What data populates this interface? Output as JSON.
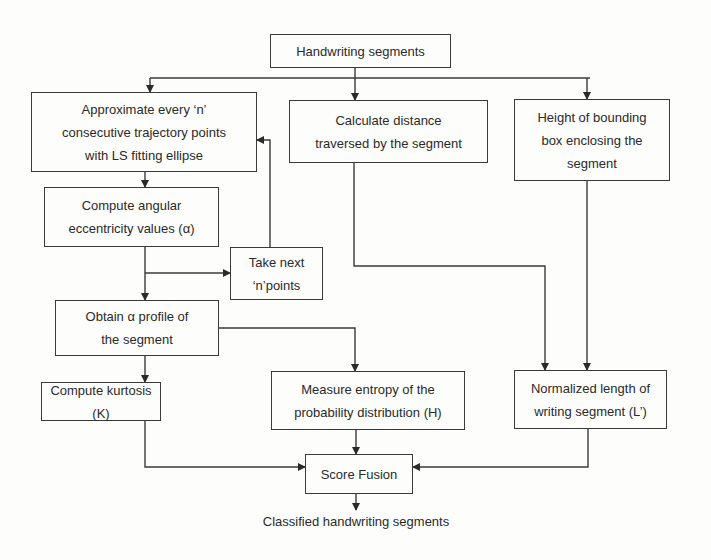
{
  "diagram": {
    "type": "flowchart",
    "nodes": {
      "input": {
        "label": "Handwriting segments"
      },
      "approx": {
        "lines": [
          "Approximate every ‘n’",
          "consecutive trajectory points",
          "with LS fitting ellipse"
        ]
      },
      "distance": {
        "lines": [
          "Calculate distance",
          "traversed by the segment"
        ]
      },
      "height": {
        "lines": [
          "Height of bounding",
          "box enclosing the",
          "segment"
        ]
      },
      "angular": {
        "lines": [
          "Compute angular",
          "eccentricity values (α)"
        ]
      },
      "next": {
        "lines": [
          "Take next",
          "‘n’points"
        ]
      },
      "profile": {
        "lines": [
          "Obtain α profile of",
          "the segment"
        ]
      },
      "kurtosis": {
        "label": "Compute kurtosis (K)"
      },
      "entropy": {
        "lines": [
          "Measure entropy of the",
          "probability distribution (H)"
        ]
      },
      "normlen": {
        "lines": [
          "Normalized length of",
          "writing segment (L’)"
        ]
      },
      "fusion": {
        "label": "Score Fusion"
      },
      "output": {
        "label": "Classified handwriting segments"
      }
    },
    "edges": [
      [
        "input",
        "approx"
      ],
      [
        "input",
        "distance"
      ],
      [
        "input",
        "height"
      ],
      [
        "approx",
        "angular"
      ],
      [
        "angular",
        "next"
      ],
      [
        "next",
        "approx"
      ],
      [
        "angular",
        "profile"
      ],
      [
        "profile",
        "kurtosis"
      ],
      [
        "profile",
        "entropy"
      ],
      [
        "distance",
        "normlen"
      ],
      [
        "height",
        "normlen"
      ],
      [
        "kurtosis",
        "fusion"
      ],
      [
        "entropy",
        "fusion"
      ],
      [
        "normlen",
        "fusion"
      ],
      [
        "fusion",
        "output"
      ]
    ]
  }
}
